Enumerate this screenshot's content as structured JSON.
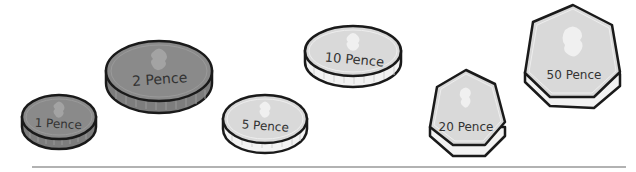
{
  "coins": [
    {
      "id": "1p",
      "label": "1 Pence",
      "shape": "round",
      "face_color": "#8a8a8a",
      "edge_color": "#7a7a7a",
      "cx": 59,
      "cy": 117,
      "rx": 37,
      "ry": 22,
      "thick": 10,
      "text_x": 58,
      "text_y": 128,
      "text_size": 12,
      "text_rotate": 3
    },
    {
      "id": "2p",
      "label": "2 Pence",
      "shape": "round",
      "face_color": "#8a8a8a",
      "edge_color": "#7a7a7a",
      "cx": 159,
      "cy": 71,
      "rx": 53,
      "ry": 30,
      "thick": 12,
      "text_x": 160,
      "text_y": 84,
      "text_size": 14,
      "text_rotate": -4
    },
    {
      "id": "5p",
      "label": "5 Pence",
      "shape": "round",
      "face_color": "#d9d9d9",
      "edge_color": "#f2f2f2",
      "cx": 265,
      "cy": 119,
      "rx": 42,
      "ry": 24,
      "thick": 10,
      "text_x": 265,
      "text_y": 130,
      "text_size": 12,
      "text_rotate": 4
    },
    {
      "id": "10p",
      "label": "10 Pence",
      "shape": "round",
      "face_color": "#d9d9d9",
      "edge_color": "#f2f2f2",
      "cx": 353,
      "cy": 51,
      "rx": 48,
      "ry": 25,
      "thick": 11,
      "text_x": 354,
      "text_y": 64,
      "text_size": 13,
      "text_rotate": 5
    },
    {
      "id": "20p",
      "label": "20 Pence",
      "shape": "heptagon",
      "face_color": "#d9d9d9",
      "edge_color": "#f2f2f2",
      "text_x": 466,
      "text_y": 131,
      "text_size": 12,
      "text_rotate": 0
    },
    {
      "id": "50p",
      "label": "50 Pence",
      "shape": "heptagon",
      "face_color": "#d9d9d9",
      "edge_color": "#f2f2f2",
      "text_x": 574,
      "text_y": 79,
      "text_size": 12,
      "text_rotate": 0
    }
  ],
  "baseline": {
    "x1": 40,
    "x2": 626,
    "y": 168,
    "color": "#999999"
  },
  "colors": {
    "outline": "#1a1a1a",
    "bronze_face": "#8a8a8a",
    "silver_face": "#d9d9d9",
    "emblem_dark": "#a3a3a3",
    "emblem_light": "#f0f0f0"
  }
}
